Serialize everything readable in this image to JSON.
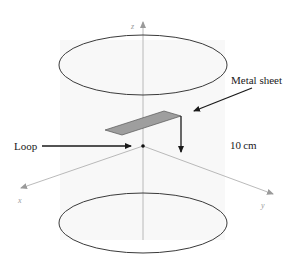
{
  "figure": {
    "type": "3D schematic of Helmholtz-like coil pair with loop and metal sheet",
    "background_color": "#ffffff",
    "panel_color": "#f7f7f7",
    "line_color": "#333333",
    "axis_color": "#9a9a9a",
    "sheet_fill": "#9e9e9e"
  },
  "labels": {
    "metal_sheet": "Metal sheet",
    "loop": "Loop",
    "distance": "10 cm"
  },
  "axes": {
    "x": "x",
    "y": "y",
    "z": "z"
  },
  "elements": {
    "coils": [
      "top-coil",
      "bottom-coil"
    ],
    "origin_marker": "loop-position-dot",
    "distance_arrow": "sheet-to-loop-distance-arrow"
  }
}
